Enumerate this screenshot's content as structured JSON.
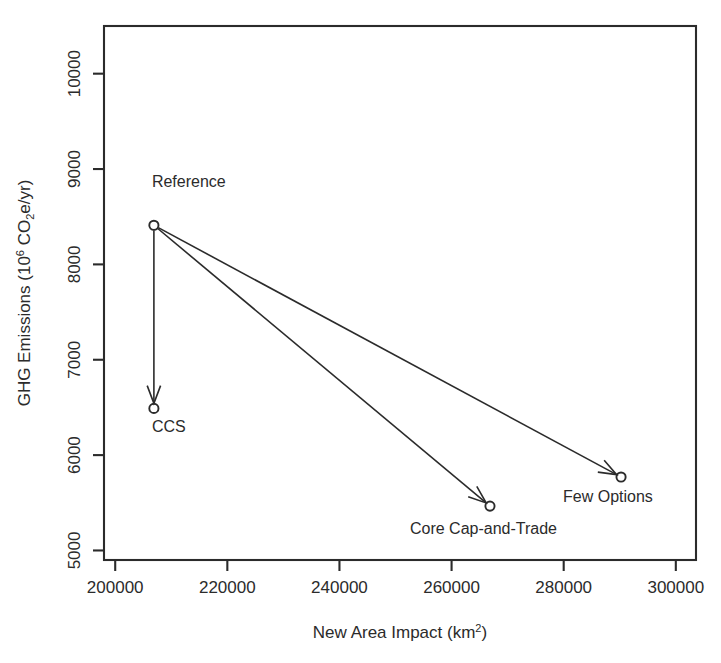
{
  "chart_data": {
    "type": "scatter",
    "title": "",
    "xlabel": "New Area Impact (km2)",
    "xlabel_base": "New Area Impact (km",
    "xlabel_sup": "2",
    "xlabel_tail": ")",
    "ylabel": "GHG Emissions (106 CO2e/yr)",
    "ylabel_part1": "GHG Emissions (10",
    "ylabel_sup": "6",
    "ylabel_part2": " CO",
    "ylabel_sub": "2",
    "ylabel_part3": "e/yr)",
    "xlim": [
      198000,
      303600
    ],
    "ylim": [
      4900,
      10500
    ],
    "grid": false,
    "legend": "none",
    "xticks": [
      200000,
      220000,
      240000,
      260000,
      280000,
      300000
    ],
    "xtick_labels": [
      "200000",
      "220000",
      "240000",
      "260000",
      "280000",
      "300000"
    ],
    "yticks": [
      5000,
      6000,
      7000,
      8000,
      9000,
      10000
    ],
    "ytick_labels": [
      "5000",
      "6000",
      "7000",
      "8000",
      "9000",
      "10000"
    ],
    "points": [
      {
        "label": "Reference",
        "x": 206900,
        "y": 8410,
        "label_dx": -2,
        "label_dy": -38,
        "anchor": "start"
      },
      {
        "label": "CCS",
        "x": 206900,
        "y": 6490,
        "label_dx": -2,
        "label_dy": 24,
        "anchor": "start"
      },
      {
        "label": "Core Cap-and-Trade",
        "x": 266850,
        "y": 5465,
        "label_dx": -80,
        "label_dy": 28,
        "anchor": "start"
      },
      {
        "label": "Few Options",
        "x": 290230,
        "y": 5770,
        "label_dx": -58,
        "label_dy": 25,
        "anchor": "start"
      }
    ],
    "arrows": [
      {
        "from": "Reference",
        "to": "CCS"
      },
      {
        "from": "Reference",
        "to": "Core Cap-and-Trade"
      },
      {
        "from": "Reference",
        "to": "Few Options"
      }
    ],
    "colors": {
      "axis": "#2b2b2b",
      "line": "#2b2b2b",
      "point": "#2b2b2b",
      "background": "#ffffff"
    }
  }
}
